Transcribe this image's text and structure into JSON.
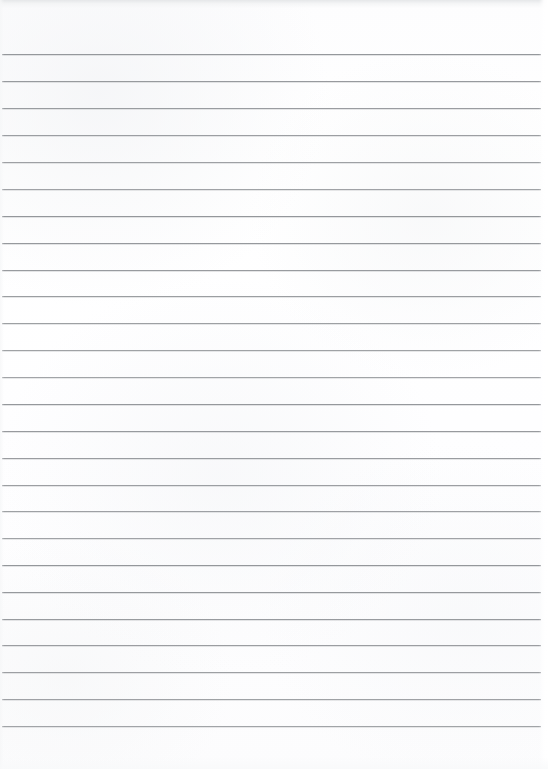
{
  "document": {
    "kind": "scanned-ruled-notebook-page",
    "title": "Lined notebook paper",
    "content_text": "",
    "is_blank": true,
    "page_width": 548,
    "page_height": 769,
    "paper_color": "#fefefe",
    "rule_color": "#8e9195",
    "top_shadow_color": "#e4e6e8",
    "ruling": {
      "line_count": 26,
      "first_line_y": 54,
      "line_spacing": 26.9,
      "line_thickness": 1,
      "line_start_x": 2,
      "line_end_x": 541,
      "margin_rule": "none",
      "holes": "none"
    },
    "lines": [
      {
        "index": 1,
        "y": 54,
        "x1": 2,
        "x2": 541,
        "text": ""
      },
      {
        "index": 2,
        "y": 81,
        "x1": 2,
        "x2": 541,
        "text": ""
      },
      {
        "index": 3,
        "y": 108,
        "x1": 2,
        "x2": 541,
        "text": ""
      },
      {
        "index": 4,
        "y": 135,
        "x1": 2,
        "x2": 541,
        "text": ""
      },
      {
        "index": 5,
        "y": 162,
        "x1": 2,
        "x2": 541,
        "text": ""
      },
      {
        "index": 6,
        "y": 189,
        "x1": 2,
        "x2": 541,
        "text": ""
      },
      {
        "index": 7,
        "y": 216,
        "x1": 2,
        "x2": 541,
        "text": ""
      },
      {
        "index": 8,
        "y": 243,
        "x1": 2,
        "x2": 541,
        "text": ""
      },
      {
        "index": 9,
        "y": 270,
        "x1": 2,
        "x2": 541,
        "text": ""
      },
      {
        "index": 10,
        "y": 296,
        "x1": 2,
        "x2": 541,
        "text": ""
      },
      {
        "index": 11,
        "y": 323,
        "x1": 2,
        "x2": 541,
        "text": ""
      },
      {
        "index": 12,
        "y": 350,
        "x1": 2,
        "x2": 541,
        "text": ""
      },
      {
        "index": 13,
        "y": 377,
        "x1": 2,
        "x2": 541,
        "text": ""
      },
      {
        "index": 14,
        "y": 404,
        "x1": 2,
        "x2": 541,
        "text": ""
      },
      {
        "index": 15,
        "y": 431,
        "x1": 2,
        "x2": 541,
        "text": ""
      },
      {
        "index": 16,
        "y": 458,
        "x1": 2,
        "x2": 541,
        "text": ""
      },
      {
        "index": 17,
        "y": 485,
        "x1": 2,
        "x2": 541,
        "text": ""
      },
      {
        "index": 18,
        "y": 511,
        "x1": 2,
        "x2": 541,
        "text": ""
      },
      {
        "index": 19,
        "y": 538,
        "x1": 2,
        "x2": 541,
        "text": ""
      },
      {
        "index": 20,
        "y": 565,
        "x1": 2,
        "x2": 541,
        "text": ""
      },
      {
        "index": 21,
        "y": 592,
        "x1": 2,
        "x2": 541,
        "text": ""
      },
      {
        "index": 22,
        "y": 619,
        "x1": 2,
        "x2": 541,
        "text": ""
      },
      {
        "index": 23,
        "y": 645,
        "x1": 2,
        "x2": 541,
        "text": ""
      },
      {
        "index": 24,
        "y": 672,
        "x1": 2,
        "x2": 541,
        "text": ""
      },
      {
        "index": 25,
        "y": 699,
        "x1": 2,
        "x2": 541,
        "text": ""
      },
      {
        "index": 26,
        "y": 726,
        "x1": 2,
        "x2": 541,
        "text": ""
      }
    ]
  }
}
